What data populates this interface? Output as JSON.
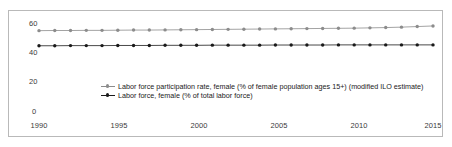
{
  "chart_data": {
    "type": "line",
    "title": "",
    "xlabel": "",
    "ylabel": "",
    "xlim": [
      1990,
      2015
    ],
    "ylim": [
      0,
      63
    ],
    "yticks": [
      0,
      20,
      40,
      60
    ],
    "ytick_labels": [
      "0",
      "20",
      "40",
      "60"
    ],
    "xticks": [
      1990,
      1995,
      2000,
      2005,
      2010,
      2015
    ],
    "xtick_labels": [
      "1990",
      "1995",
      "2000",
      "2005",
      "2010",
      "2015"
    ],
    "grid": false,
    "legend_position": "inside-center",
    "x": [
      1990,
      1991,
      1992,
      1993,
      1994,
      1995,
      1996,
      1997,
      1998,
      1999,
      2000,
      2001,
      2002,
      2003,
      2004,
      2005,
      2006,
      2007,
      2008,
      2009,
      2010,
      2011,
      2012,
      2013,
      2014,
      2015
    ],
    "series": [
      {
        "name": "Labor force participation rate, female (% of female population ages 15+) (modified ILO estimate)",
        "color": "#8c8c8c",
        "marker": "circle",
        "values": [
          54.1,
          54.2,
          54.2,
          54.3,
          54.3,
          54.4,
          54.5,
          54.5,
          54.6,
          54.7,
          54.8,
          54.9,
          55.0,
          55.1,
          55.2,
          55.3,
          55.4,
          55.5,
          55.6,
          55.7,
          55.8,
          56.0,
          56.2,
          56.5,
          56.9,
          57.3
        ]
      },
      {
        "name": "Labor force, female (% of total labor force)",
        "color": "#1a1a1a",
        "marker": "circle",
        "values": [
          43.8,
          43.8,
          43.9,
          43.9,
          43.9,
          44.0,
          44.0,
          44.0,
          44.1,
          44.1,
          44.1,
          44.2,
          44.2,
          44.2,
          44.2,
          44.3,
          44.3,
          44.3,
          44.3,
          44.4,
          44.4,
          44.4,
          44.4,
          44.4,
          44.4,
          44.4
        ]
      }
    ]
  },
  "legend": {
    "entries": [
      {
        "label": "Labor force participation rate, female (% of female population ages 15+) (modified ILO estimate)",
        "color": "#8c8c8c"
      },
      {
        "label": "Labor force, female (% of total labor force)",
        "color": "#1a1a1a"
      }
    ]
  },
  "axes": {
    "y_labels": [
      "60",
      "40",
      "20",
      "0"
    ],
    "x_labels": [
      "1990",
      "1995",
      "2000",
      "2005",
      "2010",
      "2015"
    ]
  }
}
